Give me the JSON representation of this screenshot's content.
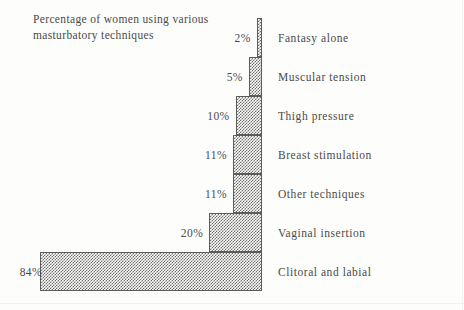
{
  "chart_data": {
    "type": "bar",
    "orientation": "horizontal-left",
    "title": "Percentage of women using various\nmasturbatory techniques",
    "xlabel": "",
    "ylabel": "",
    "xlim": [
      0,
      84
    ],
    "grid": false,
    "legend": null,
    "units": "percent",
    "baseline_side": "right",
    "categories": [
      "Fantasy alone",
      "Muscular tension",
      "Thigh pressure",
      "Breast stimulation",
      "Other techniques",
      "Vaginal insertion",
      "Clitoral and labial"
    ],
    "values": [
      2,
      5,
      10,
      11,
      11,
      20,
      84
    ],
    "value_labels": [
      "2%",
      "5%",
      "10%",
      "11%",
      "11%",
      "20%",
      "84%"
    ],
    "bars": [
      {
        "category": "Fantasy alone",
        "value": 2,
        "label": "2%"
      },
      {
        "category": "Muscular tension",
        "value": 5,
        "label": "5%"
      },
      {
        "category": "Thigh pressure",
        "value": 10,
        "label": "10%"
      },
      {
        "category": "Breast stimulation",
        "value": 11,
        "label": "11%"
      },
      {
        "category": "Other techniques",
        "value": 11,
        "label": "11%"
      },
      {
        "category": "Vaginal insertion",
        "value": 20,
        "label": "20%"
      },
      {
        "category": "Clitoral and labial",
        "value": 84,
        "label": "84%"
      }
    ],
    "colors": {
      "bar_fill": "#6e6e6c",
      "bar_stroke": "#5c5c5a",
      "text": "#4a4a48",
      "background": "#fdfdfc"
    }
  }
}
